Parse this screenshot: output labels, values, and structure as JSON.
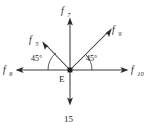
{
  "diagram": {
    "kind": "force-diagram",
    "vertex": {
      "label": "E",
      "x": 70,
      "y": 70
    },
    "background_color": "#ffffff",
    "line_color": "#3a3a3a",
    "text_color": "#1c1c1c",
    "forces": [
      {
        "id": "f7",
        "base": "f",
        "subscript": "7",
        "full_label": "f7",
        "direction": "up",
        "angle_degrees": 90
      },
      {
        "id": "f9",
        "base": "f",
        "subscript": "9",
        "full_label": "f9",
        "direction": "up-right",
        "angle_degrees": 45
      },
      {
        "id": "f5",
        "base": "f",
        "subscript": "5",
        "full_label": "f5",
        "direction": "up-left",
        "angle_degrees": 135
      },
      {
        "id": "f6",
        "base": "f",
        "subscript": "6",
        "full_label": "f6",
        "direction": "left",
        "angle_degrees": 180
      },
      {
        "id": "f10",
        "base": "f",
        "subscript": "10",
        "full_label": "f10",
        "direction": "right",
        "angle_degrees": 0
      },
      {
        "id": "load15",
        "base": "15",
        "subscript": "",
        "full_label": "15",
        "direction": "down",
        "angle_degrees": 270
      }
    ],
    "angles": [
      {
        "id": "angle-left",
        "value": "45",
        "unit": "°",
        "label": "45°",
        "between": [
          "f6",
          "f5"
        ]
      },
      {
        "id": "angle-right",
        "value": "45",
        "unit": "°",
        "label": "45°",
        "between": [
          "f10",
          "f9"
        ]
      }
    ]
  }
}
